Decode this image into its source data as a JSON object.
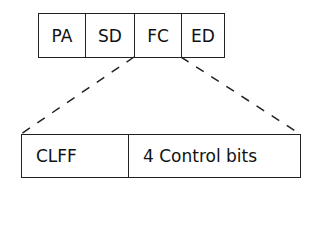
{
  "diagram": {
    "top_fields": [
      "PA",
      "SD",
      "FC",
      "ED"
    ],
    "expanded_field": "FC",
    "bottom_fields": [
      "CLFF",
      "4 Control bits"
    ]
  }
}
